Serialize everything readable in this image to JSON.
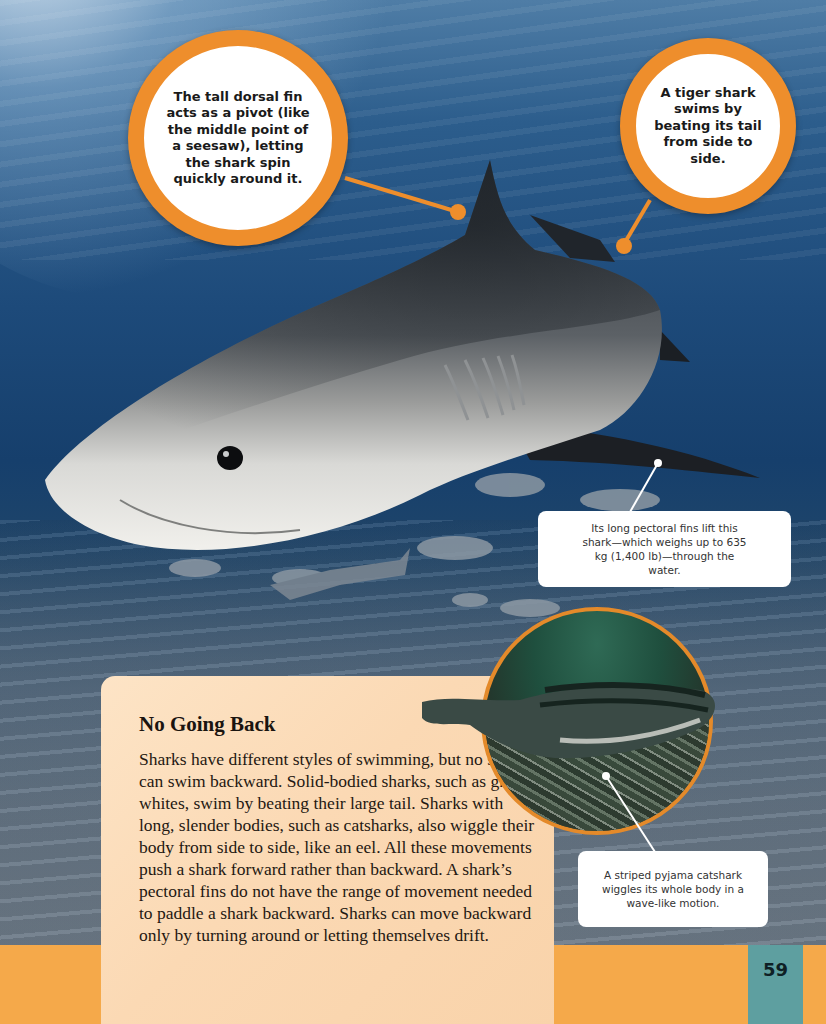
{
  "callouts": {
    "dorsal_fin": "The tall dorsal fin acts as a pivot (like the middle point of a seesaw), letting the shark spin quickly around it.",
    "tail": "A tiger shark swims by beating its tail from side to side.",
    "pectoral_fins": "Its long pectoral fins lift this shark—which weighs up to 635 kg (1,400 lb)—through the water.",
    "catshark": "A striped pyjama catshark wiggles its whole body in a wave-like motion."
  },
  "panel": {
    "title": "No Going Back",
    "body": "Sharks have different styles of swimming, but no shark can swim backward. Solid-bodied sharks, such as great whites, swim by beating their large tail. Sharks with long, slender bodies, such as catsharks, also wiggle their body from side to side, like an eel. All these movements push a shark forward rather than backward. A shark’s pectoral fins do not have the range of movement needed to paddle a shark backward. Sharks can move backward only by turning around or letting themselves drift."
  },
  "footer": {
    "page_number": "59"
  },
  "images": {
    "main": "tiger-shark-photo",
    "inset": "striped-pyjama-catshark-photo"
  },
  "colors": {
    "accent_orange": "#ee8e2c",
    "bar_orange": "#f5a94a",
    "page_tab_teal": "#5e9fa0",
    "panel_peach": "#fbd9b4"
  }
}
